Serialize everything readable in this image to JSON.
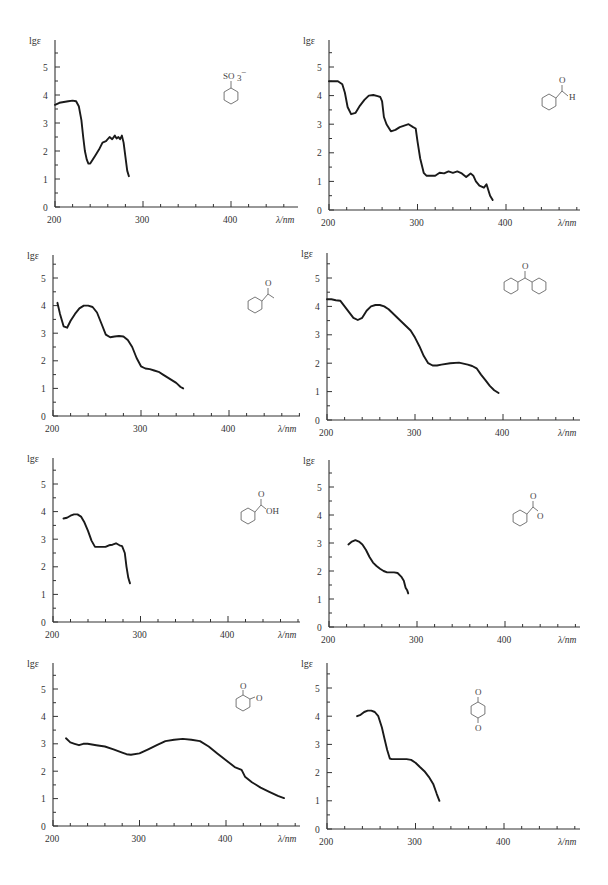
{
  "chart_data": [
    {
      "id": "benzenesulfonate",
      "type": "line",
      "title": "",
      "structure_label": "SO3-",
      "molecule": "benzenesulfonate",
      "ylabel": "lgε",
      "xlabel": "λ/nm",
      "xticks": [
        200,
        300,
        400
      ],
      "yticks": [
        0,
        1,
        2,
        3,
        4,
        5
      ],
      "xlim": [
        200,
        425
      ],
      "ylim": [
        0,
        5.8
      ],
      "frame": {
        "x0": 55,
        "y0": 207,
        "px_per_100nm": 88,
        "px_per_unit": 28,
        "x_end": 298,
        "y_top": 40
      },
      "x": [
        200,
        205,
        210,
        215,
        220,
        224,
        227,
        230,
        232,
        234,
        236,
        238,
        240,
        243,
        246,
        250,
        254,
        258,
        262,
        265,
        268,
        270,
        272,
        274,
        276,
        278,
        280,
        282,
        284
      ],
      "y": [
        3.65,
        3.72,
        3.75,
        3.78,
        3.8,
        3.78,
        3.6,
        3.1,
        2.5,
        2.0,
        1.7,
        1.55,
        1.55,
        1.7,
        1.85,
        2.05,
        2.3,
        2.35,
        2.5,
        2.42,
        2.55,
        2.45,
        2.5,
        2.42,
        2.55,
        2.3,
        1.8,
        1.3,
        1.1
      ]
    },
    {
      "id": "benzaldehyde",
      "type": "line",
      "structure_label": "H",
      "molecule": "benzaldehyde",
      "ylabel": "lgε",
      "xlabel": "λ/nm",
      "xticks": [
        200,
        300,
        400
      ],
      "yticks": [
        0,
        1,
        2,
        3,
        4,
        5
      ],
      "xlim": [
        200,
        420
      ],
      "ylim": [
        0,
        5.8
      ],
      "frame": {
        "x0": 329,
        "y0": 210,
        "px_per_100nm": 88.5,
        "px_per_unit": 28.6,
        "x_end": 580,
        "y_top": 40
      },
      "x": [
        200,
        205,
        210,
        215,
        218,
        221,
        225,
        230,
        235,
        240,
        245,
        250,
        255,
        258,
        260,
        262,
        265,
        270,
        275,
        280,
        285,
        290,
        295,
        298,
        300,
        303,
        307,
        310,
        315,
        320,
        325,
        330,
        335,
        340,
        345,
        350,
        355,
        360,
        363,
        366,
        370,
        375,
        378,
        380,
        382,
        385
      ],
      "y": [
        4.5,
        4.5,
        4.5,
        4.4,
        4.1,
        3.6,
        3.35,
        3.4,
        3.65,
        3.85,
        4.0,
        4.02,
        3.98,
        3.95,
        3.8,
        3.25,
        3.0,
        2.75,
        2.8,
        2.9,
        2.95,
        3.0,
        2.9,
        2.85,
        2.4,
        1.8,
        1.3,
        1.2,
        1.2,
        1.2,
        1.3,
        1.28,
        1.35,
        1.3,
        1.35,
        1.28,
        1.15,
        1.28,
        1.2,
        1.0,
        0.85,
        0.78,
        0.9,
        0.7,
        0.5,
        0.35
      ]
    },
    {
      "id": "acetophenone",
      "type": "line",
      "structure_label": "O",
      "molecule": "acetophenone",
      "ylabel": "lgε",
      "xlabel": "λ/nm",
      "xticks": [
        200,
        300,
        400
      ],
      "yticks": [
        0,
        1,
        2,
        3,
        4,
        5
      ],
      "xlim": [
        200,
        428
      ],
      "ylim": [
        0,
        5.8
      ],
      "frame": {
        "x0": 53,
        "y0": 416,
        "px_per_100nm": 88,
        "px_per_unit": 27.6,
        "x_end": 300,
        "y_top": 255
      },
      "x": [
        205,
        208,
        212,
        216,
        220,
        225,
        230,
        235,
        240,
        245,
        250,
        255,
        260,
        265,
        270,
        275,
        280,
        285,
        290,
        295,
        300,
        305,
        310,
        315,
        320,
        325,
        330,
        335,
        340,
        345,
        348
      ],
      "y": [
        4.1,
        3.7,
        3.25,
        3.2,
        3.45,
        3.7,
        3.9,
        4.0,
        4.0,
        3.95,
        3.75,
        3.35,
        2.95,
        2.85,
        2.88,
        2.9,
        2.88,
        2.75,
        2.5,
        2.1,
        1.8,
        1.72,
        1.7,
        1.65,
        1.6,
        1.5,
        1.4,
        1.3,
        1.2,
        1.05,
        1.0
      ]
    },
    {
      "id": "benzophenone",
      "type": "line",
      "structure_label": "O",
      "molecule": "benzophenone",
      "ylabel": "lgε",
      "xlabel": "λ/nm",
      "xticks": [
        200,
        300,
        400
      ],
      "yticks": [
        0,
        1,
        2,
        3,
        4,
        5
      ],
      "xlim": [
        200,
        428
      ],
      "ylim": [
        0,
        5.8
      ],
      "frame": {
        "x0": 327,
        "y0": 420,
        "px_per_100nm": 88,
        "px_per_unit": 28.4,
        "x_end": 580,
        "y_top": 253
      },
      "x": [
        200,
        205,
        210,
        215,
        220,
        225,
        230,
        235,
        240,
        245,
        250,
        255,
        260,
        265,
        270,
        275,
        280,
        285,
        290,
        295,
        300,
        305,
        310,
        315,
        320,
        325,
        330,
        340,
        350,
        360,
        365,
        370,
        375,
        380,
        385,
        390,
        395
      ],
      "y": [
        4.25,
        4.25,
        4.22,
        4.2,
        4.0,
        3.8,
        3.6,
        3.52,
        3.6,
        3.85,
        4.0,
        4.05,
        4.05,
        4.0,
        3.9,
        3.75,
        3.6,
        3.45,
        3.3,
        3.15,
        2.9,
        2.6,
        2.25,
        2.0,
        1.92,
        1.92,
        1.95,
        2.0,
        2.02,
        1.95,
        1.9,
        1.82,
        1.6,
        1.4,
        1.2,
        1.05,
        0.95
      ]
    },
    {
      "id": "benzoic-acid",
      "type": "line",
      "structure_label": "OH",
      "molecule": "benzoic acid",
      "ylabel": "lgε",
      "xlabel": "λ/nm",
      "xticks": [
        200,
        300,
        400
      ],
      "yticks": [
        0,
        1,
        2,
        3,
        4,
        5
      ],
      "xlim": [
        200,
        428
      ],
      "ylim": [
        0,
        5.8
      ],
      "frame": {
        "x0": 53,
        "y0": 622,
        "px_per_100nm": 87.5,
        "px_per_unit": 27.6,
        "x_end": 300,
        "y_top": 458
      },
      "x": [
        212,
        216,
        220,
        224,
        228,
        232,
        236,
        240,
        244,
        248,
        252,
        256,
        260,
        264,
        268,
        272,
        276,
        279,
        282,
        284,
        286,
        288
      ],
      "y": [
        3.75,
        3.78,
        3.85,
        3.9,
        3.9,
        3.82,
        3.6,
        3.3,
        2.95,
        2.72,
        2.72,
        2.72,
        2.72,
        2.78,
        2.8,
        2.85,
        2.78,
        2.75,
        2.5,
        2.0,
        1.6,
        1.4
      ]
    },
    {
      "id": "benzoate",
      "type": "line",
      "structure_label": "O-",
      "molecule": "benzoate anion",
      "ylabel": "lgε",
      "xlabel": "λ/nm",
      "xticks": [
        200,
        300,
        400
      ],
      "yticks": [
        0,
        1,
        2,
        3,
        4,
        5
      ],
      "xlim": [
        200,
        428
      ],
      "ylim": [
        0,
        5.8
      ],
      "frame": {
        "x0": 329,
        "y0": 627,
        "px_per_100nm": 88,
        "px_per_unit": 28,
        "x_end": 580,
        "y_top": 460
      },
      "x": [
        222,
        226,
        230,
        234,
        238,
        242,
        246,
        250,
        254,
        258,
        262,
        266,
        270,
        274,
        278,
        282,
        285,
        287,
        289,
        290
      ],
      "y": [
        2.95,
        3.05,
        3.1,
        3.05,
        2.95,
        2.75,
        2.5,
        2.3,
        2.18,
        2.08,
        2.0,
        1.95,
        1.95,
        1.95,
        1.93,
        1.8,
        1.65,
        1.4,
        1.3,
        1.2
      ]
    },
    {
      "id": "o-benzoquinone",
      "type": "line",
      "structure_label": "O",
      "molecule": "o-benzoquinone",
      "ylabel": "lgε",
      "xlabel": "λ/nm",
      "xticks": [
        200,
        300,
        400
      ],
      "yticks": [
        0,
        1,
        2,
        3,
        4,
        5
      ],
      "xlim": [
        200,
        490
      ],
      "ylim": [
        0,
        5.8
      ],
      "frame": {
        "x0": 53,
        "y0": 826,
        "px_per_100nm": 86.5,
        "px_per_unit": 27.4,
        "x_end": 300,
        "y_top": 663
      },
      "x": [
        215,
        220,
        225,
        230,
        235,
        240,
        250,
        260,
        270,
        280,
        285,
        290,
        300,
        310,
        320,
        330,
        340,
        350,
        360,
        370,
        380,
        390,
        400,
        410,
        418,
        422,
        430,
        440,
        450,
        460,
        467
      ],
      "y": [
        3.2,
        3.05,
        3.0,
        2.95,
        3.0,
        3.0,
        2.95,
        2.9,
        2.8,
        2.68,
        2.62,
        2.6,
        2.65,
        2.8,
        2.95,
        3.1,
        3.15,
        3.18,
        3.15,
        3.1,
        2.9,
        2.65,
        2.4,
        2.15,
        2.05,
        1.8,
        1.6,
        1.4,
        1.25,
        1.1,
        1.02
      ]
    },
    {
      "id": "p-benzoquinone",
      "type": "line",
      "structure_label": "O",
      "molecule": "p-benzoquinone",
      "ylabel": "lgε",
      "xlabel": "λ/nm",
      "xticks": [
        200,
        300,
        400
      ],
      "yticks": [
        0,
        1,
        2,
        3,
        4,
        5
      ],
      "xlim": [
        200,
        428
      ],
      "ylim": [
        0,
        5.8
      ],
      "frame": {
        "x0": 327,
        "y0": 829,
        "px_per_100nm": 88.5,
        "px_per_unit": 28.2,
        "x_end": 580,
        "y_top": 663
      },
      "x": [
        234,
        238,
        242,
        246,
        250,
        254,
        258,
        262,
        265,
        268,
        271,
        273,
        276,
        280,
        285,
        290,
        295,
        300,
        305,
        310,
        315,
        320,
        324,
        327
      ],
      "y": [
        4.0,
        4.05,
        4.15,
        4.2,
        4.2,
        4.15,
        4.0,
        3.6,
        3.2,
        2.8,
        2.5,
        2.48,
        2.48,
        2.48,
        2.48,
        2.48,
        2.45,
        2.35,
        2.2,
        2.05,
        1.85,
        1.6,
        1.25,
        1.0
      ]
    }
  ]
}
